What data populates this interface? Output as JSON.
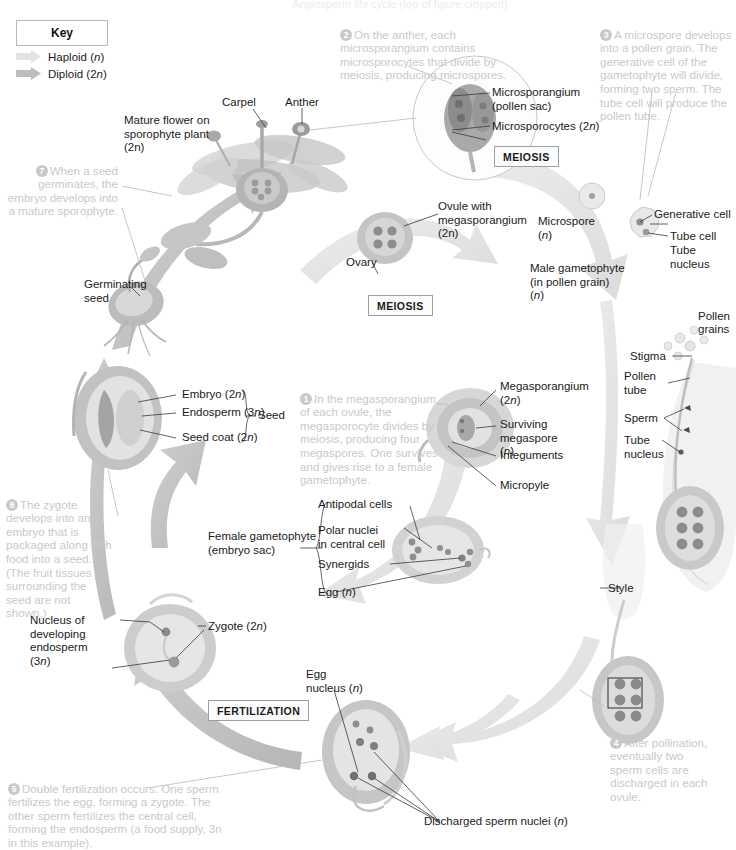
{
  "title_cut": "Angiosperm life cycle (top of figure cropped)",
  "key": {
    "heading": "Key",
    "items": [
      {
        "label": "Haploid (n)",
        "color": "#e0e0e0",
        "arrow": "haploid-arrow"
      },
      {
        "label": "Diploid (2n)",
        "color": "#bdbdbd",
        "arrow": "diploid-arrow"
      }
    ]
  },
  "stage_boxes": {
    "meiosis_anther": "MEIOSIS",
    "meiosis_ovule": "MEIOSIS",
    "fertilization": "FERTILIZATION"
  },
  "callouts": [
    {
      "n": "1",
      "text": "In the megasporangium of each ovule, the megasporocyte divides by meiosis, producing four megaspores. One survives and gives rise to a female gametophyte."
    },
    {
      "n": "2",
      "text": "On the anther, each microsporangium contains microsporocytes that divide by meiosis, producing microspores."
    },
    {
      "n": "3",
      "text": "A microspore develops into a pollen grain. The generative cell of the gametophyte will divide, forming two sperm. The tube cell will produce the pollen tube."
    },
    {
      "n": "4",
      "text": "After pollination, eventually two sperm cells are discharged in each ovule."
    },
    {
      "n": "5",
      "text": "Double fertilization occurs. One sperm fertilizes the egg, forming a zygote. The other sperm fertilizes the central cell, forming the endosperm (a food supply, 3n in this example)."
    },
    {
      "n": "6",
      "text": "The zygote develops into an embryo that is packaged along with food into a seed. (The fruit tissues surrounding the seed are not shown.)"
    },
    {
      "n": "7",
      "text": "When a seed germinates, the embryo develops into a mature sporophyte."
    }
  ],
  "labels": {
    "carpel": "Carpel",
    "anther": "Anther",
    "mature_flower": "Mature flower on\nsporophyte plant\n(2n)",
    "microsporangium": "Microsporangium\n(pollen sac)",
    "microsporocytes": "Microsporocytes (2n)",
    "ovule_with_megasporangium": "Ovule with\nmegasporangium\n(2n)",
    "ovary": "Ovary",
    "microspore": "Microspore\n(n)",
    "male_gametophyte": "Male gametophyte\n(in pollen grain)\n(n)",
    "generative_cell": "Generative cell",
    "tube_cell": "Tube cell",
    "tube_nucleus": "Tube nucleus",
    "pollen_grains": "Pollen\ngrains",
    "stigma": "Stigma",
    "pollen_tube": "Pollen\ntube",
    "sperm": "Sperm",
    "tube_nucleus_2": "Tube\nnucleus",
    "megasporangium": "Megasporangium\n(2n)",
    "surviving_megaspore": "Surviving\nmegaspore\n(n)",
    "integuments": "Integuments",
    "micropyle": "Micropyle",
    "female_gametophyte": "Female gametophyte\n(embryo sac)",
    "antipodal_cells": "Antipodal cells",
    "polar_nuclei": "Polar nuclei\nin central cell",
    "synergids": "Synergids",
    "egg": "Egg (n)",
    "style": "Style",
    "egg_nucleus": "Egg\nnucleus (n)",
    "discharged_sperm": "Discharged sperm nuclei (n)",
    "embryo": "Embryo (2n)",
    "endosperm": "Endosperm (3n)",
    "seed_coat": "Seed coat (2n)",
    "seed_brace": "Seed",
    "germinating_seed": "Germinating\nseed",
    "nucleus_developing_endosperm": "Nucleus of\ndeveloping\nendosperm\n(3n)",
    "zygote": "Zygote (2n)"
  },
  "colors": {
    "haploid": "#e3e3e3",
    "diploid": "#c2c2c2",
    "ink": "#1a1a1a",
    "callout_grey": "#c9c9c9",
    "tissue_mid": "#bdbdbd",
    "tissue_dark": "#8f8f8f"
  }
}
